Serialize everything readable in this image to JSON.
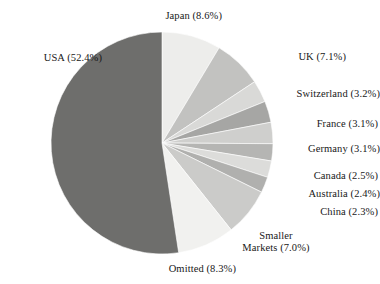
{
  "chart_data": {
    "type": "pie",
    "title": "",
    "xlabel": "",
    "ylabel": "",
    "categories": [
      "Japan",
      "UK",
      "Switzerland",
      "France",
      "Germany",
      "Canada",
      "Australia",
      "China",
      "Smaller Markets",
      "Omitted",
      "USA"
    ],
    "values": [
      8.6,
      7.1,
      3.2,
      3.1,
      3.1,
      2.5,
      2.4,
      2.3,
      7.0,
      8.3,
      52.4
    ],
    "unit": "%",
    "start_angle_deg": 0,
    "direction": "clockwise",
    "legend": "none",
    "labels_placement": "outside-callout",
    "slices": [
      {
        "name": "Japan",
        "value": 8.6,
        "label": "Japan (8.6%)",
        "color": "#ededeb"
      },
      {
        "name": "UK",
        "value": 7.1,
        "label": "UK (7.1%)",
        "color": "#c2c2c0"
      },
      {
        "name": "Switzerland",
        "value": 3.2,
        "label": "Switzerland (3.2%)",
        "color": "#d9d9d7"
      },
      {
        "name": "France",
        "value": 3.1,
        "label": "France (3.1%)",
        "color": "#a6a6a4"
      },
      {
        "name": "Germany",
        "value": 3.1,
        "label": "Germany (3.1%)",
        "color": "#cfcfcd"
      },
      {
        "name": "Canada",
        "value": 2.5,
        "label": "Canada (2.5%)",
        "color": "#b5b5b3"
      },
      {
        "name": "Australia",
        "value": 2.4,
        "label": "Australia (2.4%)",
        "color": "#dcdcda"
      },
      {
        "name": "China",
        "value": 2.3,
        "label": "China (2.3%)",
        "color": "#b0b0ae"
      },
      {
        "name": "Smaller Markets",
        "value": 7.0,
        "label": "Smaller\nMarkets (7.0%)",
        "color": "#cbcbc9"
      },
      {
        "name": "Omitted",
        "value": 8.3,
        "label": "Omitted (8.3%)",
        "color": "#f1f1ef"
      },
      {
        "name": "USA",
        "value": 52.4,
        "label": "USA (52.4%)",
        "color": "#6e6e6c"
      }
    ],
    "geometry": {
      "cx": 162,
      "cy": 143,
      "r": 111
    }
  }
}
